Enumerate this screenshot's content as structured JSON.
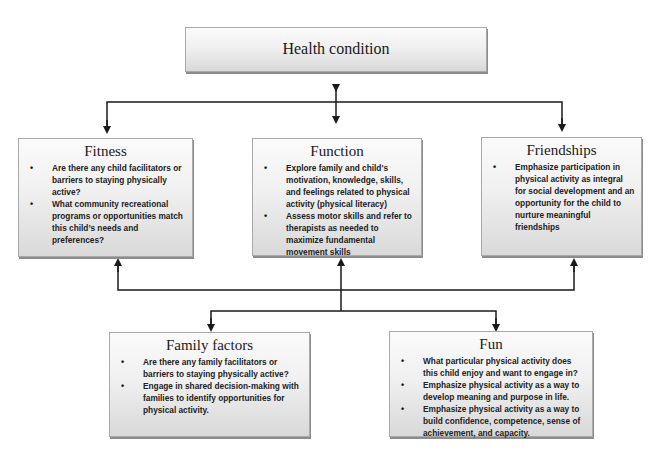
{
  "diagram": {
    "root": {
      "title": "Health condition"
    },
    "top_row": [
      {
        "id": "fitness",
        "title": "Fitness",
        "bullets": [
          "Are there any child facilitators or barriers to staying physically active?",
          "What community recreational programs or opportunities match this child’s needs and preferences?"
        ]
      },
      {
        "id": "function",
        "title": "Function",
        "bullets": [
          "Explore family and child's motivation, knowledge, skills, and feelings related to physical activity (physical literacy)",
          "Assess motor skills and refer to therapists as needed to maximize fundamental movement skills"
        ]
      },
      {
        "id": "friendships",
        "title": "Friendships",
        "bullets": [
          "Emphasize participation in physical activity as integral for social development and an opportunity for the child to nurture meaningful friendships"
        ]
      }
    ],
    "bottom_row": [
      {
        "id": "family-factors",
        "title": "Family factors",
        "bullets": [
          "Are there any family facilitators or barriers to staying physically active?",
          "Engage in shared decision-making with families to identify opportunities for physical activity."
        ]
      },
      {
        "id": "fun",
        "title": "Fun",
        "bullets": [
          "What particular physical activity does this child enjoy and want to engage in?",
          "Emphasize physical activity as a way to develop meaning and purpose in life.",
          "Emphasize physical activity as a way to build confidence, competence, sense of achievement, and capacity."
        ]
      }
    ],
    "colors": {
      "line": "#1a1a1a",
      "box_border": "#a9a9a9",
      "box_top": "#fbfbfb",
      "box_bottom": "#d9d9d9"
    }
  }
}
